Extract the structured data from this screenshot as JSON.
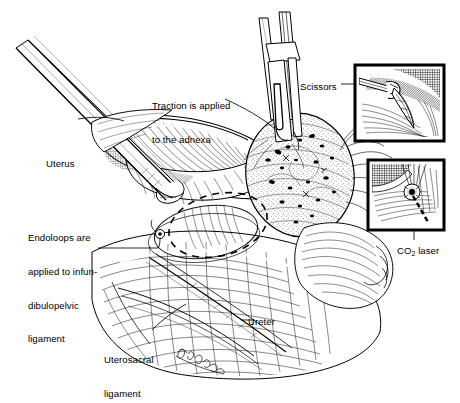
{
  "figure": {
    "style": "pen-and-ink medical line illustration",
    "background_color": "#ffffff",
    "ink_color": "#000000"
  },
  "labels": {
    "traction": {
      "line1": "Traction is applied",
      "line2": "to the adnexa",
      "x": 152,
      "y": 78
    },
    "scissors": {
      "text": "Scissors",
      "x": 300,
      "y": 81
    },
    "uterus": {
      "text": "Uterus",
      "x": 46,
      "y": 158
    },
    "endoloops": {
      "line1": "Endoloops are",
      "line2": "applied to infun-",
      "line3": "dibulopelvic",
      "line4": "ligament",
      "x": 28,
      "y": 210
    },
    "co2_laser": {
      "prefix": "CO",
      "subscript": "2",
      "suffix": " laser",
      "x": 397,
      "y": 245
    },
    "ureter": {
      "text": "Ureter",
      "x": 248,
      "y": 316
    },
    "uterosacral": {
      "line1": "Uterosacral",
      "line2": "ligament",
      "x": 104,
      "y": 332
    }
  },
  "insets": [
    {
      "name": "scissors-inset",
      "caption": "Scissors",
      "x": 355,
      "y": 65,
      "width": 89,
      "height": 76,
      "border_color": "#000000"
    },
    {
      "name": "co2-laser-inset",
      "caption": "CO2 laser",
      "x": 368,
      "y": 160,
      "width": 76,
      "height": 70,
      "border_color": "#000000"
    }
  ],
  "annotations": {
    "endoloop_dashed_oval": "dashed ellipse marking infundibulopelvic ligament loop placement",
    "artist_signature": "cursive signature in lower-center tissue"
  }
}
